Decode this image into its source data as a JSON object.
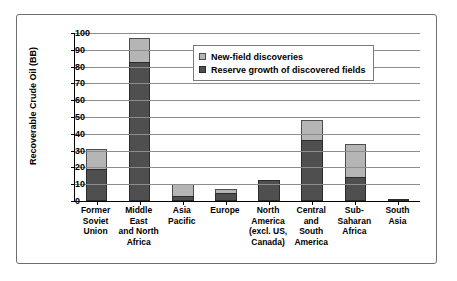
{
  "chart_data": {
    "type": "bar",
    "stacked": true,
    "title": "",
    "xlabel": "",
    "ylabel": "Recoverable Crude Oil (BB)",
    "ylim": [
      0,
      100
    ],
    "ytick_step": 10,
    "yticks": [
      "100",
      "90",
      "80",
      "70",
      "60",
      "50",
      "40",
      "30",
      "20",
      "10",
      "0"
    ],
    "grid": true,
    "legend_position": "inside-top-right",
    "categories": [
      "Former Soviet Union",
      "Middle East and North Africa",
      "Asia Pacific",
      "Europe",
      "North America (excl. US, Canada)",
      "Central and South America",
      "Sub-Saharan Africa",
      "South Asia"
    ],
    "category_label_lines": [
      [
        "Former",
        "Soviet",
        "Union"
      ],
      [
        "Middle",
        "East",
        "and North",
        "Africa"
      ],
      [
        "Asia",
        "Pacific"
      ],
      [
        "Europe"
      ],
      [
        "North",
        "America",
        "(excl. US,",
        "Canada)"
      ],
      [
        "Central",
        "and",
        "South",
        "America"
      ],
      [
        "Sub-",
        "Saharan",
        "Africa"
      ],
      [
        "South",
        "Asia"
      ]
    ],
    "series": [
      {
        "name": "Reserve growth of discovered fields",
        "color": "#4f4f4f",
        "values": [
          19,
          83,
          3,
          4.5,
          12.5,
          36.5,
          14,
          0.5
        ]
      },
      {
        "name": "New-field discoveries",
        "color": "#b5b5b5",
        "values": [
          12,
          14,
          7,
          2.5,
          0,
          12,
          20,
          0
        ]
      }
    ],
    "totals": [
      31,
      97,
      10,
      7,
      12.5,
      48.5,
      34,
      0.5
    ]
  },
  "legend": {
    "items": [
      {
        "label": "New-field discoveries",
        "color": "#b5b5b5"
      },
      {
        "label": "Reserve growth of discovered fields",
        "color": "#4f4f4f"
      }
    ]
  },
  "colors": {
    "new_field": "#b5b5b5",
    "reserve_growth": "#4f4f4f",
    "axis": "#000000",
    "grid": "#8d8d8d",
    "frame": "#6e6e6e"
  }
}
